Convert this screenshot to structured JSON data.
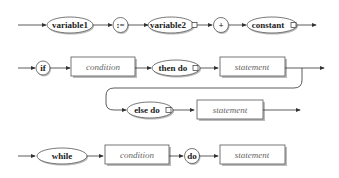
{
  "diagram": {
    "type": "syntax-railroad",
    "rows": [
      {
        "name": "assignment",
        "nodes": [
          {
            "kind": "terminal-ellipse",
            "label": "variable1",
            "has_square": false
          },
          {
            "kind": "terminal-circle",
            "label": ":="
          },
          {
            "kind": "terminal-ellipse",
            "label": "variable2",
            "has_square": true
          },
          {
            "kind": "terminal-circle",
            "label": "+"
          },
          {
            "kind": "terminal-ellipse",
            "label": "constant",
            "has_square": true
          }
        ]
      },
      {
        "name": "if-statement",
        "nodes": [
          {
            "kind": "terminal-circle",
            "label": "if"
          },
          {
            "kind": "nonterminal-box",
            "label": "condition"
          },
          {
            "kind": "terminal-ellipse",
            "label": "then do",
            "has_square": true
          },
          {
            "kind": "nonterminal-box",
            "label": "statement"
          }
        ],
        "branch": [
          {
            "kind": "terminal-ellipse",
            "label": "else do",
            "has_square": true
          },
          {
            "kind": "nonterminal-box",
            "label": "statement"
          }
        ]
      },
      {
        "name": "while-statement",
        "nodes": [
          {
            "kind": "terminal-ellipse",
            "label": "while",
            "has_square": false
          },
          {
            "kind": "nonterminal-box",
            "label": "condition"
          },
          {
            "kind": "terminal-circle",
            "label": "do"
          },
          {
            "kind": "nonterminal-box",
            "label": "statement"
          }
        ]
      }
    ]
  },
  "labels": {
    "variable1": "variable1",
    "assign": ":=",
    "variable2": "variable2",
    "plus": "+",
    "constant": "constant",
    "if": "if",
    "condition": "condition",
    "then_do": "then do",
    "statement": "statement",
    "else_do": "else do",
    "while": "while",
    "do": "do"
  }
}
